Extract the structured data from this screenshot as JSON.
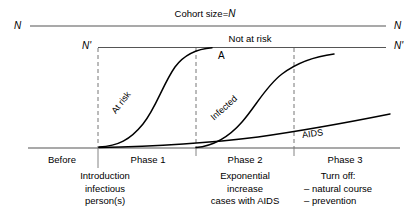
{
  "figure": {
    "title_top": "Cohort size=N",
    "title_top_plain": "Cohort size=",
    "title_top_italic": "N",
    "not_at_risk": "Not at risk",
    "axis_left_top": "N",
    "axis_right_top": "N",
    "axis_left_second": "N'",
    "axis_right_second": "N'",
    "point_label": "A",
    "curves": [
      {
        "name": "at-risk",
        "label": "At risk"
      },
      {
        "name": "infected",
        "label": "Infected"
      },
      {
        "name": "aids",
        "label": "AIDS"
      }
    ],
    "phases": [
      {
        "name": "before",
        "label": "Before"
      },
      {
        "name": "phase-1",
        "label": "Phase 1"
      },
      {
        "name": "phase-2",
        "label": "Phase 2"
      },
      {
        "name": "phase-3",
        "label": "Phase 3"
      }
    ],
    "annotations": {
      "introduction": {
        "line1": "Introduction",
        "line2": "infectious",
        "line3": "person(s)"
      },
      "exponential": {
        "line1": "Exponential",
        "line2": "increase",
        "line3": "cases with AIDS"
      },
      "turn_off": {
        "line1": "Turn off:",
        "line2": "– natural course",
        "line3": "– prevention"
      }
    },
    "colors": {
      "ink": "#000000",
      "rule": "#555555",
      "dashed": "#777777",
      "background": "#ffffff"
    }
  }
}
